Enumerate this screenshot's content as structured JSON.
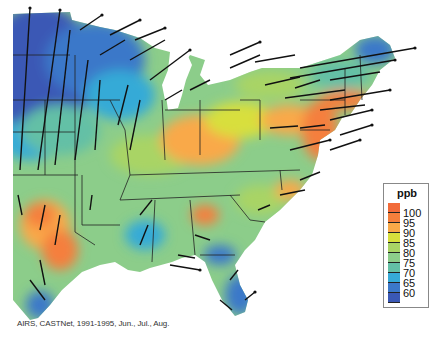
{
  "figure": {
    "caption": "AIRS, CASTNet, 1991-1995, Jun., Jul., Aug."
  },
  "legend": {
    "title": "ppb",
    "swatches": [
      {
        "color": "#f26b3a",
        "label": ""
      },
      {
        "color": "#f57f3c",
        "label": "100"
      },
      {
        "color": "#f9a948",
        "label": "95"
      },
      {
        "color": "#d8df3c",
        "label": "90"
      },
      {
        "color": "#a9d465",
        "label": "85"
      },
      {
        "color": "#8ccd8a",
        "label": "80"
      },
      {
        "color": "#63c0a6",
        "label": "75"
      },
      {
        "color": "#36aad7",
        "label": "70"
      },
      {
        "color": "#3b78c9",
        "label": "65"
      },
      {
        "color": "#3a58b5",
        "label": "60"
      }
    ],
    "labels": [
      "100",
      "95",
      "90",
      "85",
      "80",
      "75",
      "70",
      "65",
      "60"
    ]
  },
  "regions": [
    {
      "name": "upper-midwest",
      "level": "low",
      "color": "#3a58b5"
    },
    {
      "name": "northeast-corridor",
      "level": "high",
      "color": "#f57f3c"
    },
    {
      "name": "ohio-valley",
      "level": "high",
      "color": "#f9a948"
    },
    {
      "name": "east-texas",
      "level": "high",
      "color": "#f57f3c"
    },
    {
      "name": "florida",
      "level": "low",
      "color": "#3b78c9"
    },
    {
      "name": "maine",
      "level": "low",
      "color": "#3b78c9"
    }
  ]
}
